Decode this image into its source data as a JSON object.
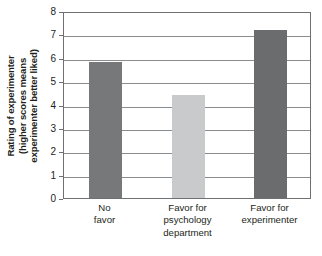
{
  "chart_data": {
    "type": "bar",
    "title": "",
    "subtitle": "",
    "xlabel": "",
    "ylabel": "Rating of experimenter (higher scores means experimenter better liked)",
    "ylabel_lines": [
      "Rating of experimenter",
      "(higher scores means",
      "experimenter better liked)"
    ],
    "categories": [
      "No favor",
      "Favor for psychology department",
      "Favor for experimenter"
    ],
    "category_lines": [
      [
        "No",
        "favor"
      ],
      [
        "Favor for",
        "psychology",
        "department"
      ],
      [
        "Favor for",
        "experimenter"
      ]
    ],
    "values": [
      5.8,
      4.4,
      7.2
    ],
    "ylim": [
      0,
      8
    ],
    "ytick_values": [
      0,
      1,
      2,
      3,
      4,
      5,
      6,
      7,
      8
    ],
    "ytick_labels": [
      "0",
      "1",
      "2",
      "3",
      "4",
      "5",
      "6",
      "7",
      "8"
    ],
    "grid": true,
    "grid_axis": "y",
    "legend": false,
    "legend_position": "none",
    "bar_colors": [
      "#777879",
      "#c9cacb",
      "#6b6c6e"
    ],
    "frame_color": "#6f7072",
    "grid_color": "#8a8c8e",
    "background_color": "#ffffff",
    "text_color": "#231f20"
  }
}
